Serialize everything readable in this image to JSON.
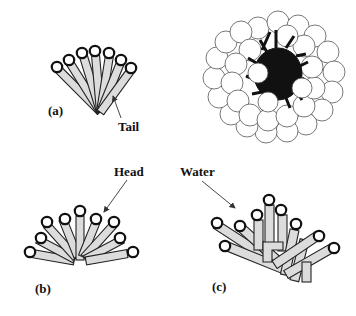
{
  "figure": {
    "panels": [
      {
        "id": "a",
        "label": "(a)",
        "description": "Fan of surfactant molecules converging at tails"
      },
      {
        "id": "micelle",
        "label": "",
        "description": "Spherical micelle: head groups as circles around dark hydrophobic core"
      },
      {
        "id": "b",
        "label": "(b)",
        "description": "Semicircular arrangement of surfactant molecules"
      },
      {
        "id": "c",
        "label": "(c)",
        "description": "Disordered aggregate of surfactant molecules with water penetration"
      }
    ],
    "annotations": {
      "tail": "Tail",
      "head": "Head",
      "water": "Water"
    },
    "colors": {
      "tail_fill": "#dcdcdc",
      "head_stroke": "#111111",
      "core": "#111111",
      "background": "#ffffff"
    }
  }
}
